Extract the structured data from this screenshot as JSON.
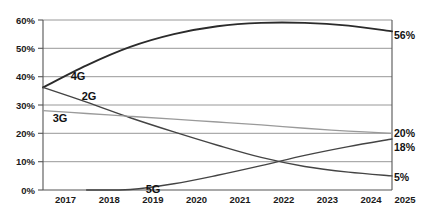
{
  "chart_data": {
    "type": "line",
    "title": "",
    "subtitle": "",
    "xlabel": "",
    "ylabel": "",
    "x": [
      2017,
      2018,
      2019,
      2020,
      2021,
      2022,
      2023,
      2024,
      2025
    ],
    "xtick_labels": [
      "2017",
      "2018",
      "2019",
      "2020",
      "2021",
      "2022",
      "2023",
      "2024",
      "2025"
    ],
    "ytick_labels": [
      "0%",
      "10%",
      "20%",
      "30%",
      "40%",
      "50%",
      "60%"
    ],
    "ytick_values": [
      0,
      10,
      20,
      30,
      40,
      50,
      60
    ],
    "ylim": [
      0,
      60
    ],
    "xlim": [
      2017,
      2025
    ],
    "grid": true,
    "legend_position": "inline-series-labels",
    "series": [
      {
        "name": "4G",
        "color": "#2b2b2b",
        "width": 1.9,
        "values": [
          36.2,
          44.0,
          50.5,
          55.0,
          57.8,
          59.0,
          59.0,
          58.0,
          56.0
        ],
        "label_text": "4G",
        "end_label": "56%"
      },
      {
        "name": "2G",
        "color": "#444444",
        "width": 1.4,
        "values": [
          36.2,
          31.0,
          25.5,
          20.5,
          15.8,
          11.5,
          8.3,
          6.3,
          5.0
        ],
        "label_text": "2G",
        "end_label": "5%"
      },
      {
        "name": "3G",
        "color": "#9a9a9a",
        "width": 1.3,
        "values": [
          28.0,
          27.0,
          26.0,
          25.0,
          24.0,
          23.0,
          21.8,
          20.8,
          20.0
        ],
        "label_text": "3G",
        "end_label": "20%"
      },
      {
        "name": "5G",
        "color": "#444444",
        "width": 1.4,
        "values": [
          0.0,
          0.0,
          0.2,
          2.2,
          5.2,
          8.6,
          12.2,
          15.3,
          18.0
        ],
        "label_text": "5G",
        "end_label": "18%"
      }
    ],
    "annotations": [
      {
        "name": "label-4g",
        "text": "4G",
        "x_px": 78,
        "y_px": 76
      },
      {
        "name": "label-2g",
        "text": "2G",
        "x_px": 89,
        "y_px": 96
      },
      {
        "name": "label-3g",
        "text": "3G",
        "x_px": 60,
        "y_px": 118
      },
      {
        "name": "label-5g",
        "text": "5G",
        "x_px": 153,
        "y_px": 189
      },
      {
        "name": "end-label-56",
        "text": "56%",
        "x_px": 396,
        "y_px": 36
      },
      {
        "name": "end-label-20",
        "text": "20%",
        "x_px": 396,
        "y_px": 134
      },
      {
        "name": "end-label-18",
        "text": "18%",
        "x_px": 396,
        "y_px": 148
      },
      {
        "name": "end-label-5",
        "text": "5%",
        "x_px": 396,
        "y_px": 178
      }
    ]
  },
  "plot": {
    "left_px": 43,
    "right_px": 392,
    "top_px": 20,
    "bottom_px": 190
  }
}
